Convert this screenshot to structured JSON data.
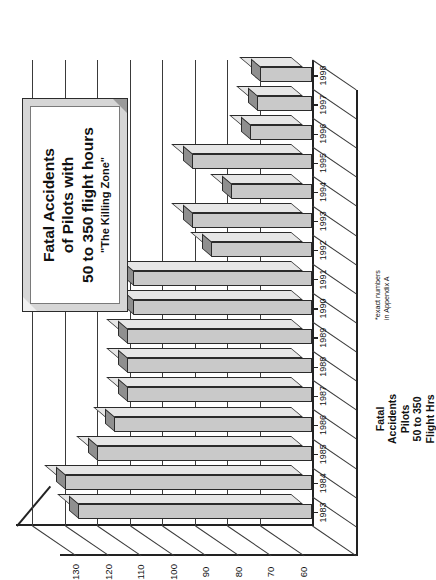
{
  "chart_data": {
    "type": "bar",
    "orientation": "vertical",
    "title_lines": [
      "Fatal Accidents",
      "of Pilots with",
      "50 to 350 flight hours"
    ],
    "subtitle": "\"The Killing Zone\"",
    "xlabel": "",
    "ylabel": "Fatal Accidents Pilots 50 to 350 Flight Hrs",
    "ylabel_lines": [
      "Fatal",
      "Accidents",
      "Pilots",
      "50 to 350",
      "Flight Hrs"
    ],
    "footnote": "*exact numbers in Appendix A",
    "footnote_lines": [
      "*exact numbers",
      "in Appendix A"
    ],
    "categories": [
      "1983",
      "1984",
      "1985",
      "1986",
      "1987",
      "1988",
      "1989",
      "1990",
      "1991",
      "1992",
      "1993",
      "1994",
      "1995",
      "1996",
      "1997",
      "1998"
    ],
    "values": [
      116,
      120,
      110,
      105,
      101,
      101,
      101,
      99,
      99,
      75,
      81,
      69,
      81,
      63,
      61,
      60
    ],
    "ytick_labels": [
      "130",
      "120",
      "110",
      "100",
      "90",
      "80",
      "70",
      "60"
    ],
    "ytick_values": [
      130,
      120,
      110,
      100,
      90,
      80,
      70,
      60
    ],
    "ylim": [
      44,
      135
    ],
    "grid": true,
    "legend": "none",
    "style": "3d-bar",
    "colors": {
      "bar_face": "#c9c9c9",
      "bar_top": "#8f8f8f",
      "bar_side": "#e6e6e6",
      "outline": "#2b2b2b",
      "grid": "#3a3a3a",
      "title_box_frame": "#d6d6d6",
      "title_box_fill": "#ffffff",
      "background": "#ffffff"
    }
  }
}
